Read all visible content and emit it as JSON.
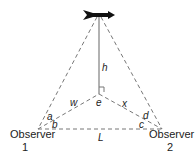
{
  "diagram": {
    "labels": {
      "h": "h",
      "w": "w",
      "x": "x",
      "e": "e",
      "a": "a",
      "b": "b",
      "c": "c",
      "d": "d",
      "L": "L"
    },
    "observers": [
      {
        "name": "Observer",
        "number": "1"
      },
      {
        "name": "Observer",
        "number": "2"
      }
    ],
    "top_icon": "weathervane-arrow-icon"
  }
}
